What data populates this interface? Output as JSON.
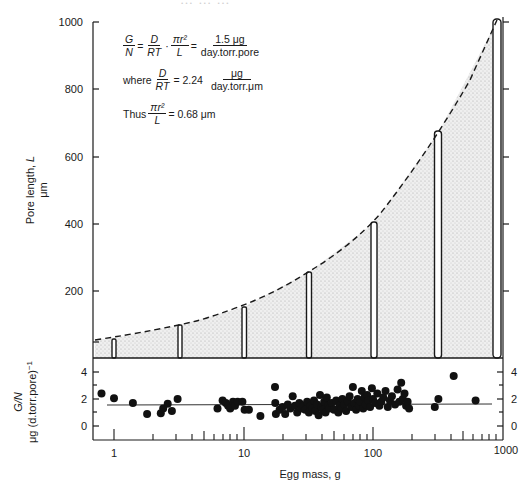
{
  "header": {
    "cropped_title_fragment": "… … …"
  },
  "equations": {
    "line1": {
      "lhs_num": "G",
      "lhs_den": "N",
      "eq1": "=",
      "f2_num": "D",
      "f2_den": "RT",
      "dot": "·",
      "f3_num": "πr²",
      "f3_den": "L",
      "eq2": "=",
      "rhs_num": "1.5 μg",
      "rhs_den": "day.torr.pore"
    },
    "line2": {
      "prefix": "where",
      "f_num": "D",
      "f_den": "RT",
      "eq": "= 2.24",
      "unit_num": "μg",
      "unit_den": "day.torr.μm"
    },
    "line3": {
      "prefix": "Thus",
      "f_num": "πr²",
      "f_den": "L",
      "rhs": "= 0.68 μm"
    }
  },
  "chart_data": [
    {
      "type": "bar",
      "panel": "upper",
      "title": "",
      "xlabel": "Egg mass, g",
      "ylabel": "Pore length, L μm",
      "xscale": "log",
      "xlim": [
        0.8,
        1000
      ],
      "ylim": [
        0,
        1000
      ],
      "yticks": [
        200,
        400,
        600,
        800,
        1000
      ],
      "ytick_labels": [
        "200",
        "400",
        "600",
        "800",
        "1000"
      ],
      "bars": {
        "x": [
          1,
          3.2,
          10,
          32,
          100,
          316,
          900
        ],
        "values": [
          50,
          100,
          150,
          255,
          400,
          665,
          1005
        ]
      },
      "fitted_curve": {
        "style": "dashed",
        "description": "Pore length increases with egg mass; shaded region under dashed curve",
        "x": [
          0.8,
          1,
          3.2,
          10,
          32,
          100,
          316,
          900
        ],
        "y": [
          48,
          52,
          98,
          152,
          255,
          400,
          665,
          1005
        ]
      },
      "grid": false
    },
    {
      "type": "scatter",
      "panel": "lower",
      "xlabel": "Egg mass, g",
      "ylabel": "G/N μg (d.torr.pore)⁻¹",
      "xscale": "log",
      "xlim": [
        0.7,
        1000
      ],
      "ylim": [
        -1,
        5
      ],
      "yticks": [
        0,
        2,
        4
      ],
      "ytick_labels": [
        "0",
        "2",
        "4"
      ],
      "xtick_labels": [
        "1",
        "10",
        "100",
        "1000"
      ],
      "reference_line": {
        "y": 1.5,
        "style": "solid thin"
      },
      "points": [
        [
          0.8,
          2.4
        ],
        [
          1.0,
          2.05
        ],
        [
          1.4,
          1.7
        ],
        [
          1.8,
          0.9
        ],
        [
          2.3,
          0.95
        ],
        [
          2.4,
          1.3
        ],
        [
          2.6,
          1.65
        ],
        [
          2.8,
          1.1
        ],
        [
          3.1,
          2.0
        ],
        [
          6.3,
          1.3
        ],
        [
          6.9,
          1.9
        ],
        [
          7.3,
          1.7
        ],
        [
          7.6,
          1.5
        ],
        [
          7.9,
          1.3
        ],
        [
          8.3,
          1.8
        ],
        [
          8.6,
          1.5
        ],
        [
          9.0,
          1.8
        ],
        [
          9.8,
          1.8
        ],
        [
          10.2,
          1.2
        ],
        [
          11.0,
          1.2
        ],
        [
          13.5,
          0.75
        ],
        [
          17.5,
          2.9
        ],
        [
          17.6,
          1.7
        ],
        [
          17.8,
          0.9
        ],
        [
          19,
          1.2
        ],
        [
          20,
          1.4
        ],
        [
          21,
          0.9
        ],
        [
          22,
          1.6
        ],
        [
          23,
          1.3
        ],
        [
          24,
          2.2
        ],
        [
          25,
          1.5
        ],
        [
          26,
          1.0
        ],
        [
          27,
          1.7
        ],
        [
          28,
          1.3
        ],
        [
          29,
          1.5
        ],
        [
          30,
          1.2
        ],
        [
          31,
          1.8
        ],
        [
          32,
          1.0
        ],
        [
          33,
          1.5
        ],
        [
          34,
          1.3
        ],
        [
          35,
          1.9
        ],
        [
          36,
          1.1
        ],
        [
          37,
          1.6
        ],
        [
          38,
          0.8
        ],
        [
          39,
          2.3
        ],
        [
          40,
          1.4
        ],
        [
          41,
          1.2
        ],
        [
          42,
          1.8
        ],
        [
          43,
          1.0
        ],
        [
          44,
          2.1
        ],
        [
          45,
          1.5
        ],
        [
          46,
          1.3
        ],
        [
          48,
          1.7
        ],
        [
          50,
          1.2
        ],
        [
          52,
          1.9
        ],
        [
          54,
          1.0
        ],
        [
          55,
          1.5
        ],
        [
          57,
          1.3
        ],
        [
          58,
          2.0
        ],
        [
          60,
          1.6
        ],
        [
          62,
          1.1
        ],
        [
          64,
          1.8
        ],
        [
          66,
          2.2
        ],
        [
          68,
          1.4
        ],
        [
          70,
          2.9
        ],
        [
          72,
          1.7
        ],
        [
          74,
          1.2
        ],
        [
          76,
          2.0
        ],
        [
          78,
          1.5
        ],
        [
          80,
          1.8
        ],
        [
          82,
          2.6
        ],
        [
          84,
          1.3
        ],
        [
          86,
          2.1
        ],
        [
          88,
          1.6
        ],
        [
          90,
          2.3
        ],
        [
          92,
          1.9
        ],
        [
          95,
          1.4
        ],
        [
          98,
          2.8
        ],
        [
          100,
          2.0
        ],
        [
          104,
          1.7
        ],
        [
          108,
          2.4
        ],
        [
          112,
          1.5
        ],
        [
          116,
          1.8
        ],
        [
          120,
          2.1
        ],
        [
          125,
          2.6
        ],
        [
          130,
          1.4
        ],
        [
          135,
          1.9
        ],
        [
          140,
          2.2
        ],
        [
          148,
          1.6
        ],
        [
          155,
          2.7
        ],
        [
          160,
          1.8
        ],
        [
          165,
          3.2
        ],
        [
          170,
          2.0
        ],
        [
          175,
          2.4
        ],
        [
          180,
          1.5
        ],
        [
          185,
          1.8
        ],
        [
          190,
          1.3
        ],
        [
          300,
          1.4
        ],
        [
          320,
          2.0
        ],
        [
          420,
          3.7
        ],
        [
          620,
          1.9
        ]
      ]
    }
  ]
}
